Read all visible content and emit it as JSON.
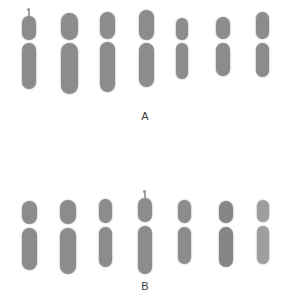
{
  "figure": {
    "width": 290,
    "height": 305,
    "background_color": "#ffffff",
    "chromosome_color": "#8c8c8c",
    "label_color": "#3a3a3a"
  },
  "panels": [
    {
      "id": "panel-a",
      "label": "A",
      "label_x": 145,
      "label_y": 110,
      "row_top": 8,
      "chromosomes": [
        {
          "index": 1,
          "x": 22,
          "width": 14,
          "shade": "normal",
          "satellite": true,
          "satellite_dot": {
            "x": 5,
            "y": 0,
            "size": 3
          },
          "satellite_stalk": {
            "x": 6,
            "y": 3,
            "width": 2,
            "height": 5
          },
          "short_arm": {
            "y": 8,
            "height": 24
          },
          "long_arm": {
            "y": 35,
            "height": 46
          }
        },
        {
          "index": 2,
          "x": 61,
          "width": 17,
          "shade": "normal",
          "satellite": false,
          "short_arm": {
            "y": 5,
            "height": 27
          },
          "long_arm": {
            "y": 35,
            "height": 51
          }
        },
        {
          "index": 3,
          "x": 100,
          "width": 15,
          "shade": "normal",
          "satellite": false,
          "short_arm": {
            "y": 4,
            "height": 27
          },
          "long_arm": {
            "y": 34,
            "height": 50
          }
        },
        {
          "index": 4,
          "x": 139,
          "width": 15,
          "shade": "normal",
          "satellite": false,
          "short_arm": {
            "y": 2,
            "height": 30
          },
          "long_arm": {
            "y": 35,
            "height": 44
          }
        },
        {
          "index": 5,
          "x": 176,
          "width": 12,
          "shade": "normal",
          "satellite": false,
          "short_arm": {
            "y": 10,
            "height": 22
          },
          "long_arm": {
            "y": 35,
            "height": 36
          }
        },
        {
          "index": 6,
          "x": 216,
          "width": 14,
          "shade": "normal",
          "satellite": false,
          "short_arm": {
            "y": 9,
            "height": 22
          },
          "long_arm": {
            "y": 35,
            "height": 33
          }
        },
        {
          "index": 7,
          "x": 256,
          "width": 13,
          "shade": "normal",
          "satellite": false,
          "short_arm": {
            "y": 4,
            "height": 27
          },
          "long_arm": {
            "y": 35,
            "height": 34
          }
        }
      ]
    },
    {
      "id": "panel-b",
      "label": "B",
      "label_x": 145,
      "label_y": 280,
      "row_top": 190,
      "chromosomes": [
        {
          "index": 1,
          "x": 22,
          "width": 15,
          "shade": "normal",
          "satellite": false,
          "short_arm": {
            "y": 11,
            "height": 23
          },
          "long_arm": {
            "y": 38,
            "height": 42
          }
        },
        {
          "index": 2,
          "x": 60,
          "width": 16,
          "shade": "normal",
          "satellite": false,
          "short_arm": {
            "y": 10,
            "height": 24
          },
          "long_arm": {
            "y": 38,
            "height": 46
          }
        },
        {
          "index": 3,
          "x": 99,
          "width": 13,
          "shade": "normal",
          "satellite": false,
          "short_arm": {
            "y": 9,
            "height": 24
          },
          "long_arm": {
            "y": 37,
            "height": 40
          }
        },
        {
          "index": 4,
          "x": 138,
          "width": 14,
          "shade": "normal",
          "satellite": true,
          "satellite_dot": {
            "x": 5,
            "y": 0,
            "size": 3
          },
          "satellite_stalk": {
            "x": 6,
            "y": 3,
            "width": 2,
            "height": 5
          },
          "short_arm": {
            "y": 8,
            "height": 24
          },
          "long_arm": {
            "y": 36,
            "height": 48
          }
        },
        {
          "index": 5,
          "x": 178,
          "width": 13,
          "shade": "normal",
          "satellite": false,
          "short_arm": {
            "y": 10,
            "height": 23
          },
          "long_arm": {
            "y": 37,
            "height": 37
          }
        },
        {
          "index": 6,
          "x": 219,
          "width": 14,
          "shade": "dark",
          "satellite": false,
          "short_arm": {
            "y": 11,
            "height": 22
          },
          "long_arm": {
            "y": 37,
            "height": 40
          }
        },
        {
          "index": 7,
          "x": 257,
          "width": 12,
          "shade": "light",
          "satellite": false,
          "short_arm": {
            "y": 10,
            "height": 22
          },
          "long_arm": {
            "y": 36,
            "height": 38
          }
        }
      ]
    }
  ]
}
